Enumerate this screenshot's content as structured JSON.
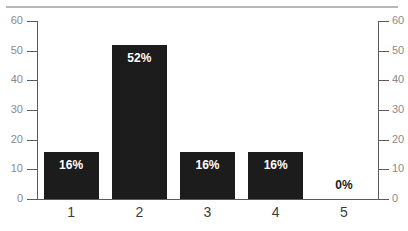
{
  "chart_data": {
    "type": "bar",
    "title": "",
    "subtitle": "",
    "xlabel": "",
    "ylabel": "",
    "categories": [
      "1",
      "2",
      "3",
      "4",
      "5"
    ],
    "values": [
      16,
      52,
      16,
      16,
      0
    ],
    "data_labels": [
      "16%",
      "52%",
      "16%",
      "16%",
      "0%"
    ],
    "series": [
      {
        "name": "",
        "values": [
          16,
          52,
          16,
          16,
          0
        ]
      }
    ],
    "ylim": [
      0,
      60
    ],
    "ytick_interval": 10,
    "yticks_left": [
      "0",
      "10",
      "20",
      "30",
      "40",
      "50",
      "60"
    ],
    "yticks_right": [
      "0",
      "10",
      "20",
      "30",
      "40",
      "50",
      "60"
    ],
    "dual_axis": true,
    "grid": false,
    "legend": false,
    "legend_position": "none",
    "bar_color": "#1c1c1c",
    "axis_color": "#5a5a5a",
    "tick_label_color": "#8a8a8a",
    "category_label_color": "#3c3c3c",
    "label_inside_color": "#ffffff",
    "label_outside_color": "#1c1c1c",
    "background_color": "#ffffff",
    "top_rule_color": "#b9b9b9"
  }
}
